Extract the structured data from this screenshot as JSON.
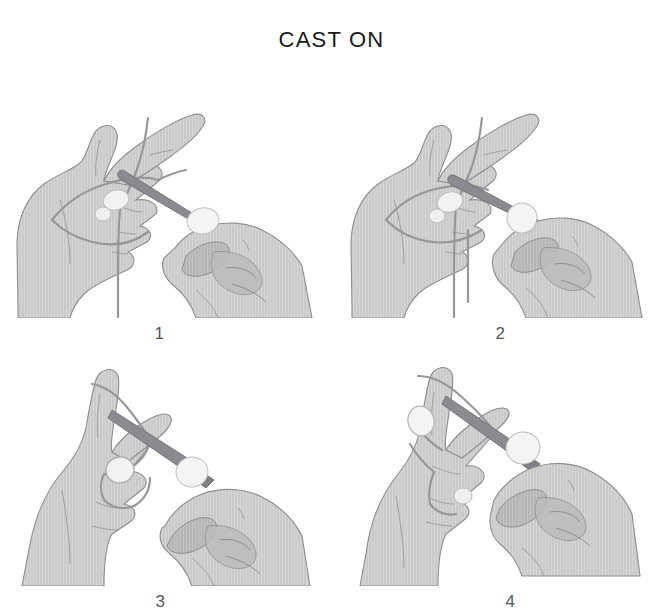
{
  "document": {
    "title": "CAST ON",
    "kind": "knitting-instruction-illustration",
    "background_color": "#ffffff"
  },
  "palette": {
    "skin_fill": "#c9c9c9",
    "skin_fill_light": "#d6d6d6",
    "skin_shadow": "#aeaeae",
    "outline": "#8d8d8f",
    "outline_dark": "#6f7073",
    "needle": "#8a8b90",
    "needle_dark": "#6e6f74",
    "yarn": "#9b9c9f",
    "nail": "#f2f2f2",
    "nail_edge": "#bdbdbd",
    "text": "#1a1a1a",
    "label_text": "#55565a"
  },
  "panels": [
    {
      "number": "1",
      "caption_number": "1",
      "alt": "Left hand with yarn slip-loop over thumb and index finger, right hand holding the knitting needle pointed up-left through the loop; yarn tail hangs below the left hand.",
      "elements": [
        "left-hand",
        "right-hand",
        "knitting-needle",
        "yarn-loop-over-index",
        "yarn-strand-over-thumb",
        "yarn-tail-hanging",
        "fingernail-thumb",
        "fingernail-index",
        "fingernail-right-thumb"
      ]
    },
    {
      "number": "2",
      "caption_number": "2",
      "alt": "Same grip as step 1; the needle has been drawn further through and the yarn loop now wraps closer to the needle tip, two yarn ends hang below.",
      "elements": [
        "left-hand",
        "right-hand",
        "knitting-needle",
        "yarn-loop-over-index",
        "yarn-strand-over-thumb",
        "yarn-tail-hanging",
        "fingernail-thumb",
        "fingernail-index",
        "fingernail-right-thumb"
      ]
    },
    {
      "number": "3",
      "caption_number": "3",
      "alt": "Left hand raised with the thumb up; the needle crosses diagonally from upper-left to lower-right while the yarn loop slides off the left thumb.",
      "elements": [
        "left-hand",
        "right-hand",
        "knitting-needle",
        "yarn-loop-over-thumb",
        "yarn-strand-diagonal",
        "fingernail-thumb",
        "fingernail-right-thumb"
      ]
    },
    {
      "number": "4",
      "caption_number": "4",
      "alt": "Loop tightened onto the needle; the left hand releases while the right hand holds the needle, completing the cast-on stitch.",
      "elements": [
        "left-hand",
        "right-hand",
        "knitting-needle",
        "yarn-strand-tightened",
        "fingernail-thumb",
        "fingernail-left-finger",
        "fingernail-right-thumb"
      ]
    }
  ]
}
